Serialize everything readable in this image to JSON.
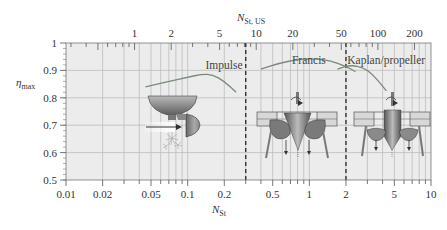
{
  "chart_data": {
    "type": "line",
    "title": "",
    "xlabel": "N_St",
    "xlabel_main": "N",
    "xlabel_sub": "St",
    "ylabel": "η_max",
    "ylabel_main": "η",
    "ylabel_sub": "max",
    "x2label": "N_St, US",
    "x2label_main": "N",
    "x2label_sub": "St, US",
    "xscale": "log",
    "xlim": [
      0.01,
      10
    ],
    "ylim": [
      0.5,
      1.0
    ],
    "grid": true,
    "x_ticks": [
      "0.01",
      "0.02",
      "0.05",
      "0.1",
      "0.2",
      "0.5",
      "1",
      "2",
      "5",
      "10"
    ],
    "x_tick_values": [
      0.01,
      0.02,
      0.05,
      0.1,
      0.2,
      0.5,
      1,
      2,
      5,
      10
    ],
    "y_ticks": [
      "0.5",
      "0.6",
      "0.7",
      "0.8",
      "0.9",
      "1"
    ],
    "y_tick_values": [
      0.5,
      0.6,
      0.7,
      0.8,
      0.9,
      1.0
    ],
    "x2_ticks": [
      "1",
      "2",
      "5",
      "10",
      "20",
      "50",
      "100",
      "200"
    ],
    "x2_tick_positions_NSt": [
      0.0366,
      0.0732,
      0.183,
      0.366,
      0.732,
      1.83,
      3.66,
      7.32
    ],
    "dividers": [
      {
        "name": "impulse-francis-boundary",
        "x": 0.3,
        "style": "dashed"
      },
      {
        "name": "francis-kaplan-boundary",
        "x": 2.0,
        "style": "dashed"
      }
    ],
    "series": [
      {
        "name": "Impulse",
        "label_pos": {
          "x": 0.14,
          "y": 0.905
        },
        "x": [
          0.045,
          0.07,
          0.1,
          0.13,
          0.16,
          0.2,
          0.25
        ],
        "y": [
          0.84,
          0.86,
          0.875,
          0.886,
          0.885,
          0.86,
          0.82
        ]
      },
      {
        "name": "Francis",
        "label_pos": {
          "x": 0.72,
          "y": 0.925
        },
        "x": [
          0.4,
          0.55,
          0.8,
          1.1,
          1.5,
          2.0,
          2.4
        ],
        "y": [
          0.905,
          0.925,
          0.94,
          0.943,
          0.935,
          0.915,
          0.895
        ]
      },
      {
        "name": "Kaplan/propeller",
        "label_pos": {
          "x": 2.05,
          "y": 0.925
        },
        "x": [
          1.7,
          2.2,
          2.8,
          3.3,
          3.8,
          4.3
        ],
        "y": [
          0.905,
          0.92,
          0.91,
          0.885,
          0.855,
          0.825
        ]
      }
    ]
  },
  "colors": {
    "plot_bg": "#ececec",
    "grid": "#bdbdbd",
    "axis": "#555555",
    "curve": "#7a8a7a",
    "divider": "#333333"
  },
  "illustrations": [
    {
      "name": "impulse-turbine-illustration",
      "description": "Pelton bucket with water jet arrow and spray"
    },
    {
      "name": "francis-turbine-illustration",
      "description": "Francis runner cross-section with guide vanes and draft tube"
    },
    {
      "name": "kaplan-turbine-illustration",
      "description": "Kaplan/propeller runner cross-section with hub and draft tube"
    }
  ]
}
